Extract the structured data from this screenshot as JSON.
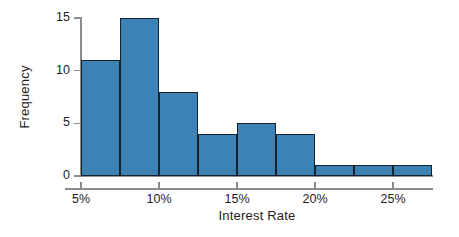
{
  "chart_data": {
    "type": "bar",
    "title": "",
    "subtitle": "",
    "xlabel": "Interest Rate",
    "ylabel": "Frequency",
    "bin_width": 2.5,
    "bin_unit": "%",
    "bin_starts": [
      5,
      7.5,
      10,
      12.5,
      15,
      17.5,
      20,
      22.5,
      25
    ],
    "categories": [
      "5%-7.5%",
      "7.5%-10%",
      "10%-12.5%",
      "12.5%-15%",
      "15%-17.5%",
      "17.5%-20%",
      "20%-22.5%",
      "22.5%-25%",
      "25%-27.5%"
    ],
    "values": [
      11,
      15,
      8,
      4,
      5,
      4,
      1,
      1,
      1
    ],
    "xlim": [
      5,
      27.5
    ],
    "ylim": [
      0,
      15
    ],
    "x_tick_labels": [
      "5%",
      "10%",
      "15%",
      "20%",
      "25%"
    ],
    "x_tick_values": [
      5,
      10,
      15,
      20,
      25
    ],
    "y_tick_labels": [
      "0",
      "5",
      "10",
      "15"
    ],
    "y_tick_values": [
      0,
      5,
      10,
      15
    ],
    "grid": false,
    "legend": null,
    "colors": {
      "bar_fill": "#3C82B4",
      "bar_edge": "#17222F",
      "axis": "#8C8C8C",
      "text": "#1D1D1D",
      "background": "#FFFFFF"
    }
  }
}
